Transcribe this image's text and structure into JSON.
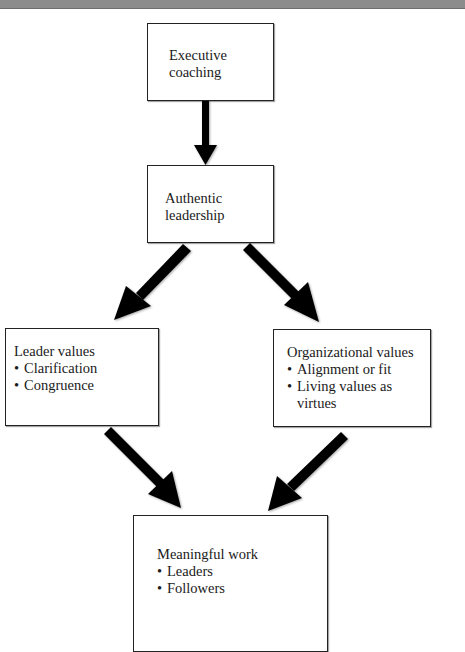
{
  "diagram": {
    "type": "flowchart",
    "nodes": [
      {
        "id": "executive_coaching",
        "title": "Executive coaching",
        "title_lines": [
          "Executive",
          "coaching"
        ],
        "bullets": []
      },
      {
        "id": "authentic_leadership",
        "title": "Authentic leadership",
        "title_lines": [
          "Authentic",
          "leadership"
        ],
        "bullets": []
      },
      {
        "id": "leader_values",
        "title": "Leader values",
        "title_lines": [
          "Leader values"
        ],
        "bullets": [
          "Clarification",
          "Congruence"
        ]
      },
      {
        "id": "organizational_values",
        "title": "Organizational values",
        "title_lines": [
          "Organizational values"
        ],
        "bullets": [
          "Alignment or fit",
          "Living values as virtues"
        ]
      },
      {
        "id": "meaningful_work",
        "title": "Meaningful work",
        "title_lines": [
          "Meaningful work"
        ],
        "bullets": [
          "Leaders",
          "Followers"
        ]
      }
    ],
    "edges": [
      {
        "from": "executive_coaching",
        "to": "authentic_leadership"
      },
      {
        "from": "authentic_leadership",
        "to": "leader_values"
      },
      {
        "from": "authentic_leadership",
        "to": "organizational_values"
      },
      {
        "from": "leader_values",
        "to": "meaningful_work"
      },
      {
        "from": "organizational_values",
        "to": "meaningful_work"
      }
    ],
    "colors": {
      "arrow": "#000000",
      "border": "#222222",
      "topbar": "#8c8c8c"
    }
  }
}
